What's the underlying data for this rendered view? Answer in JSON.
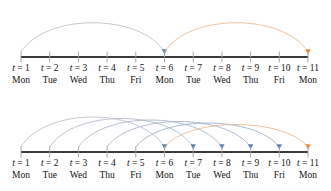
{
  "figure": {
    "colors": {
      "axis": "#3a3a3a",
      "tick": "#9aa0a8",
      "arc_blue": "#8ea4c8",
      "arc_grey": "#b9bec7",
      "arc_orange": "#e7b98c",
      "arrow_blue": "#5b7db1",
      "arrow_orange": "#e08b3a",
      "text": "#111111",
      "background": "#ffffff"
    },
    "timesteps": [
      {
        "t_label": "t = 1",
        "t_symbol": "t",
        "t_value": "= 1",
        "day": "Mon"
      },
      {
        "t_label": "t = 2",
        "t_symbol": "t",
        "t_value": "= 2",
        "day": "Tue"
      },
      {
        "t_label": "t = 3",
        "t_symbol": "t",
        "t_value": "= 3",
        "day": "Wed"
      },
      {
        "t_label": "t = 4",
        "t_symbol": "t",
        "t_value": "= 4",
        "day": "Thu"
      },
      {
        "t_label": "t = 5",
        "t_symbol": "t",
        "t_value": "= 5",
        "day": "Fri"
      },
      {
        "t_label": "t = 6",
        "t_symbol": "t",
        "t_value": "= 6",
        "day": "Mon"
      },
      {
        "t_label": "t = 7",
        "t_symbol": "t",
        "t_value": "= 7",
        "day": "Tue"
      },
      {
        "t_label": "t = 8",
        "t_symbol": "t",
        "t_value": "= 8",
        "day": "Wed"
      },
      {
        "t_label": "t = 9",
        "t_symbol": "t",
        "t_value": "= 9",
        "day": "Thu"
      },
      {
        "t_label": "t = 10",
        "t_symbol": "t",
        "t_value": "= 10",
        "day": "Fri"
      },
      {
        "t_label": "t = 11",
        "t_symbol": "t",
        "t_value": "= 11",
        "day": "Mon"
      }
    ],
    "panels": [
      {
        "name": "top-timeline",
        "axis_y": 57,
        "label_y": 62,
        "arcs": [
          {
            "from": 1,
            "to": 6,
            "color": "#b9bec7",
            "arrow_color": "#5b7db1",
            "height": 44
          },
          {
            "from": 6,
            "to": 11,
            "color": "#e7b98c",
            "arrow_color": "#e08b3a",
            "height": 44
          }
        ]
      },
      {
        "name": "bottom-timeline",
        "axis_y": 152,
        "label_y": 157,
        "arcs": [
          {
            "from": 1,
            "to": 6,
            "color": "#b9bec7",
            "arrow_color": "#5b7db1",
            "height": 45
          },
          {
            "from": 2,
            "to": 7,
            "color": "#b0b8c6",
            "arrow_color": "#5b7db1",
            "height": 43
          },
          {
            "from": 3,
            "to": 8,
            "color": "#a8b4c8",
            "arrow_color": "#5b7db1",
            "height": 41
          },
          {
            "from": 4,
            "to": 9,
            "color": "#a0b0c8",
            "arrow_color": "#5b7db1",
            "height": 39
          },
          {
            "from": 5,
            "to": 10,
            "color": "#98adc9",
            "arrow_color": "#5b7db1",
            "height": 37
          },
          {
            "from": 6,
            "to": 11,
            "color": "#e7b98c",
            "arrow_color": "#e08b3a",
            "height": 35
          }
        ]
      }
    ],
    "geometry": {
      "x_first": 21,
      "x_step": 28.7
    }
  }
}
